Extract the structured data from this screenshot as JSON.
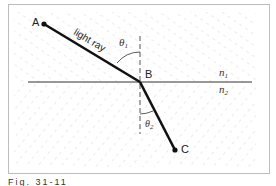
{
  "diagram": {
    "type": "refraction",
    "points": {
      "A": {
        "label": "A",
        "x": 44,
        "y": 24
      },
      "B": {
        "label": "B",
        "x": 140,
        "y": 82
      },
      "C": {
        "label": "C",
        "x": 175,
        "y": 150
      }
    },
    "ray_label": "light ray",
    "angle_incident_label": "θ",
    "angle_incident_sub": "1",
    "angle_refracted_label": "θ",
    "angle_refracted_sub": "2",
    "medium_top_label": "n",
    "medium_top_sub": "1",
    "medium_bottom_label": "n",
    "medium_bottom_sub": "2",
    "colors": {
      "frame": "#bdbdbd",
      "ray": "#111111",
      "interface": "#333333",
      "hatch": "#c8c8c8"
    }
  },
  "caption": "Fig. 31-11"
}
